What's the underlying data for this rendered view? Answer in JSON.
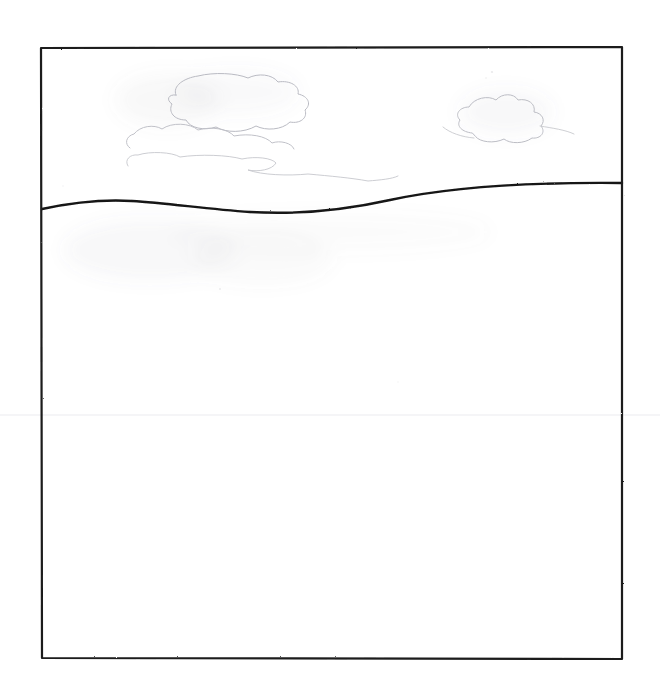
{
  "artwork": {
    "title": "Horizon with Clouds",
    "medium": "pencil sketch on white paper",
    "caption": "Hand-drawn rectangular frame enclosing a wavy horizon line with faint cloud outlines above",
    "background_color": "#ffffff",
    "paper_color": "#ffffff"
  },
  "frame": {
    "name": "drawing-border",
    "stroke_color": "#1a1a1a",
    "stroke_width": 2.2,
    "left": 41,
    "top": 48,
    "right": 622,
    "bottom": 659,
    "corners": {
      "top_left": "41,48",
      "top_right": "622,47",
      "bottom_right": "622,659",
      "bottom_left": "42,658"
    }
  },
  "horizon": {
    "name": "horizon-line",
    "stroke_color": "#151515",
    "stroke_width": 2.4,
    "left_endpoint_y": 209,
    "right_endpoint_y": 183,
    "crest_x": 132,
    "crest_y": 201,
    "trough_x": 286,
    "trough_y": 212,
    "path": "M 42,209 C 70,203 100,199 132,201 C 168,203 205,209 250,212 C 300,215 345,210 390,200 C 445,188 520,182 622,183"
  },
  "clouds": [
    {
      "name": "cloud-upper-left",
      "stroke_color": "#b9bac2",
      "stroke_width": 1.0,
      "bounds": "120,72 to 315,135",
      "path": "M 176,95 C 172,86 184,78 198,76 C 214,72 236,73 248,78 C 258,73 272,74 278,82 C 290,80 300,86 298,94 C 308,96 312,104 305,110 C 308,118 300,124 290,122 C 282,130 266,131 256,126 C 244,133 226,133 216,127 C 204,131 190,128 186,120 C 174,120 168,112 172,104 C 166,100 168,94 176,95 Z"
    },
    {
      "name": "cloud-left-shelf",
      "stroke_color": "#c0c1c8",
      "stroke_width": 1.0,
      "bounds": "124,118 to 300,150",
      "path": "M 130,148 C 124,144 126,136 134,134 C 140,126 154,124 162,129 C 172,122 190,123 198,130 C 212,126 228,129 234,136 C 250,133 266,136 272,143 C 280,140 292,143 294,149"
    },
    {
      "name": "cloud-wisp-long",
      "stroke_color": "#c6c7cd",
      "stroke_width": 0.9,
      "bounds": "126,150 to 400,185",
      "path": "M 128,166 C 124,160 130,154 138,155 C 150,151 172,152 180,157 C 200,154 228,155 242,159 C 256,156 272,158 276,163 C 272,170 258,172 248,170 C 262,175 288,176 308,174 C 330,176 352,178 368,181 C 380,180 392,179 398,176"
    },
    {
      "name": "cloud-right",
      "stroke_color": "#bcbdc4",
      "stroke_width": 1.0,
      "bounds": "452,92 to 562,144",
      "path": "M 472,133 C 462,132 456,126 460,120 C 454,114 460,107 469,107 C 474,98 488,95 496,100 C 502,93 514,93 518,100 C 528,98 536,104 534,112 C 542,113 546,120 541,126 C 546,132 541,139 532,138 C 524,144 510,144 504,139 C 494,144 480,142 476,137 Z"
    },
    {
      "name": "cloud-right-tail",
      "stroke_color": "#c8c9ce",
      "stroke_width": 0.9,
      "bounds": "440,120 to 578,150",
      "path": "M 443,127 C 450,133 462,137 474,138 M 540,126 C 552,128 566,130 574,134"
    }
  ],
  "smudges": [
    {
      "name": "smudge-sky-upper-left",
      "cx": 168,
      "cy": 100,
      "rx": 52,
      "ry": 26,
      "opacity": 0.055
    },
    {
      "name": "smudge-sky-center",
      "cx": 236,
      "cy": 92,
      "rx": 62,
      "ry": 22,
      "opacity": 0.045
    },
    {
      "name": "smudge-sky-right",
      "cx": 506,
      "cy": 112,
      "rx": 46,
      "ry": 22,
      "opacity": 0.05
    },
    {
      "name": "smudge-ground-left",
      "cx": 150,
      "cy": 250,
      "rx": 86,
      "ry": 30,
      "opacity": 0.05
    },
    {
      "name": "smudge-ground-center",
      "cx": 262,
      "cy": 258,
      "rx": 70,
      "ry": 26,
      "opacity": 0.04
    },
    {
      "name": "smudge-ground-wide",
      "cx": 330,
      "cy": 232,
      "rx": 160,
      "ry": 18,
      "opacity": 0.03
    }
  ],
  "scan_artifacts": {
    "name": "scan-seam-line",
    "y": 415,
    "color": "#f2f2f4",
    "note": "faint horizontal scanner seam across full width"
  },
  "speckles": [
    {
      "cx": 492,
      "cy": 72,
      "r": 1.1,
      "opacity": 0.22
    },
    {
      "cx": 486,
      "cy": 78,
      "r": 0.8,
      "opacity": 0.18
    },
    {
      "cx": 220,
      "cy": 289,
      "r": 0.9,
      "opacity": 0.2
    },
    {
      "cx": 398,
      "cy": 382,
      "r": 0.8,
      "opacity": 0.12
    },
    {
      "cx": 63,
      "cy": 186,
      "r": 0.8,
      "opacity": 0.14
    }
  ]
}
